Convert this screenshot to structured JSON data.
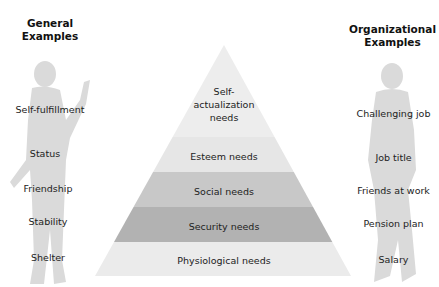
{
  "left_column": {
    "title_line1": "General",
    "title_line2": "Examples",
    "items": [
      "Self-fulfillment",
      "Status",
      "Friendship",
      "Stability",
      "Shelter"
    ]
  },
  "right_column": {
    "title_line1": "Organizational",
    "title_line2": "Examples",
    "items": [
      "Challenging job",
      "Job title",
      "Friends at work",
      "Pension plan",
      "Salary"
    ]
  },
  "pyramid": {
    "levels": [
      {
        "line1": "Self-",
        "line2": "actualization",
        "line3": "needs",
        "color": "#ededed"
      },
      {
        "label": "Esteem needs",
        "color": "#e7e7e7"
      },
      {
        "label": "Social needs",
        "color": "#c9c9c9"
      },
      {
        "label": "Security needs",
        "color": "#b3b3b3"
      },
      {
        "label": "Physiological needs",
        "color": "#ececec"
      }
    ]
  },
  "colors": {
    "silhouette": "#d6d6d6",
    "text": "#222222"
  }
}
